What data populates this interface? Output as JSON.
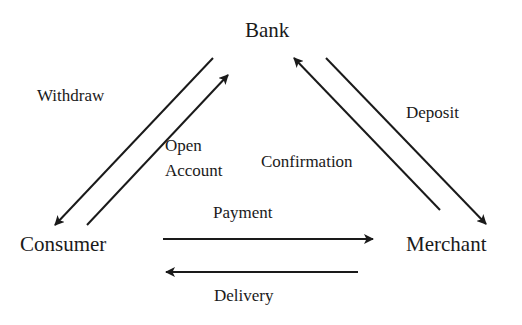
{
  "colors": {
    "ink": "#1a1a1a",
    "background": "#ffffff"
  },
  "nodes": {
    "bank": {
      "label": "Bank"
    },
    "consumer": {
      "label": "Consumer"
    },
    "merchant": {
      "label": "Merchant"
    }
  },
  "edges": {
    "withdraw": {
      "label": "Withdraw",
      "from": "Bank",
      "to": "Consumer"
    },
    "open_account": {
      "label_line1": "Open",
      "label_line2": "Account",
      "from": "Consumer",
      "to": "Bank"
    },
    "confirmation": {
      "label": "Confirmation",
      "from": "Merchant",
      "to": "Bank"
    },
    "deposit": {
      "label": "Deposit",
      "from": "Bank",
      "to": "Merchant"
    },
    "payment": {
      "label": "Payment",
      "from": "Consumer",
      "to": "Merchant"
    },
    "delivery": {
      "label": "Delivery",
      "from": "Merchant",
      "to": "Consumer"
    }
  }
}
